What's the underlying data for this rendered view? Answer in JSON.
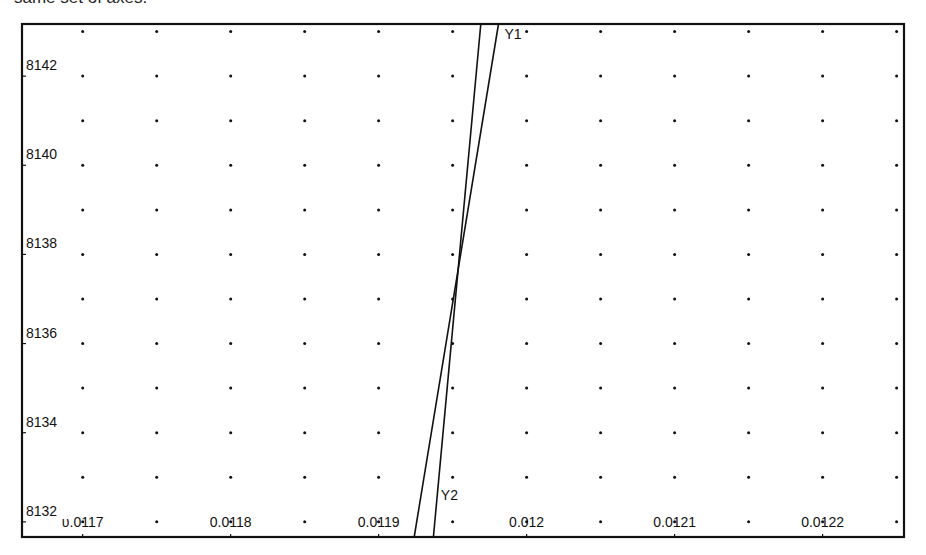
{
  "caption": "same set of axes.",
  "chart_data": {
    "type": "line",
    "title": "",
    "xlabel": "",
    "ylabel": "",
    "xlim": [
      0.011659,
      0.012255
    ],
    "ylim": [
      8131.66,
      8143.17
    ],
    "grid": "dots",
    "x_ticks": [
      0.0117,
      0.0118,
      0.0119,
      0.012,
      0.0121,
      0.0122
    ],
    "x_tick_labels": [
      "υ.0117",
      "0.0118",
      "0.0119",
      "0.012",
      "0.0121",
      "0.0122"
    ],
    "y_ticks": [
      8132,
      8134,
      8136,
      8138,
      8140,
      8142
    ],
    "y_tick_labels": [
      "8132",
      "8134",
      "8136",
      "8138",
      "8140",
      "8142"
    ],
    "grid_x_step": 5e-05,
    "grid_y_step": 1,
    "series": [
      {
        "name": "Y1",
        "x": [
          0.011924,
          0.011981
        ],
        "y": [
          8131.66,
          8143.17
        ],
        "label_pos": {
          "x": 0.011985,
          "y": 8142.95
        }
      },
      {
        "name": "Y2",
        "x": [
          0.011937,
          0.011969
        ],
        "y": [
          8131.66,
          8143.17
        ],
        "label_pos": {
          "x": 0.011942,
          "y": 8132.6
        }
      }
    ],
    "intersection": {
      "x": 0.011953,
      "y": 8137.56
    },
    "legend": "none"
  }
}
